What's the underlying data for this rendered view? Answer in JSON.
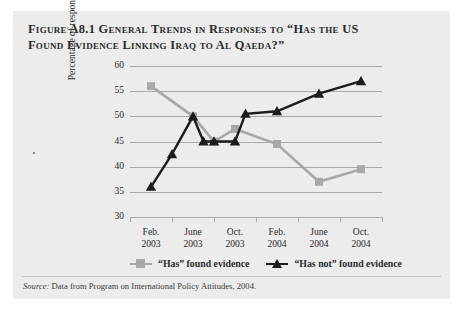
{
  "figure": {
    "title_line1": "Figure A8.1 General Trends in Responses to “Has the US",
    "title_line2": "Found Evidence Linking Iraq to Al Qaeda?”",
    "source_label": "Source:",
    "source_text": " Data from Program on International Policy Attitudes, 2004."
  },
  "legend": {
    "items": [
      {
        "label": "“Has” found evidence",
        "marker": "square-marker",
        "color": "#a8a8a8"
      },
      {
        "label": "“Has not” found evidence",
        "marker": "triangle-marker",
        "color": "#1c1c1c"
      }
    ]
  },
  "chart_data": {
    "type": "line",
    "title": "General Trends in Responses to “Has the US Found Evidence Linking Iraq to Al Qaeda?”",
    "xlabel": "",
    "ylabel": "Percentage of respondents",
    "categories": [
      "Feb.\n2003",
      "June\n2003",
      "Oct.\n2003",
      "Feb.\n2004",
      "June\n2004",
      "Oct.\n2004"
    ],
    "category_month": [
      "Feb.",
      "June",
      "Oct.",
      "Feb.",
      "June",
      "Oct."
    ],
    "category_year": [
      "2003",
      "2003",
      "2003",
      "2004",
      "2004",
      "2004"
    ],
    "ylim": [
      30,
      60
    ],
    "yticks": [
      30,
      35,
      40,
      45,
      50,
      55,
      60
    ],
    "grid": true,
    "legend_position": "bottom",
    "series": [
      {
        "name": "“Has” found evidence",
        "color": "#a8a8a8",
        "marker": "square",
        "x": [
          0,
          1,
          1.5,
          2,
          3,
          4,
          5
        ],
        "values": [
          56,
          50,
          45,
          47.5,
          44.5,
          37,
          39.5
        ]
      },
      {
        "name": "“Has not” found evidence",
        "color": "#1c1c1c",
        "marker": "triangle",
        "x": [
          0,
          0.5,
          1,
          1.25,
          1.5,
          2,
          2.25,
          3,
          4,
          5
        ],
        "values": [
          36,
          42.5,
          50,
          45,
          45,
          45,
          50.5,
          51,
          54.5,
          57
        ]
      }
    ]
  },
  "colors": {
    "panel_background": "#ececec",
    "page_background": "#ffffff",
    "grid": "#a9a9a9",
    "text": "#2b2b2b",
    "series_has": "#a8a8a8",
    "series_hasnot": "#1c1c1c"
  }
}
